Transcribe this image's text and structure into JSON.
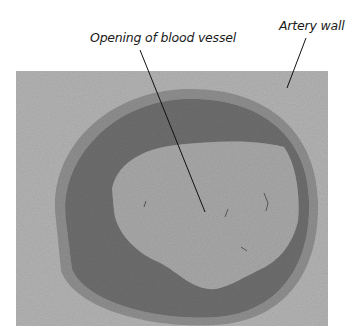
{
  "figure": {
    "labels": {
      "lumen": "Opening of blood vessel",
      "wall": "Artery wall"
    },
    "colors": {
      "background": "#ffffff",
      "tissue": "#b3b3b3",
      "wall": "#6e6e6e",
      "wall_outer_ring": "#8a8a8a",
      "lumen": "#a8a8a8",
      "leader_line": "#111111"
    }
  }
}
